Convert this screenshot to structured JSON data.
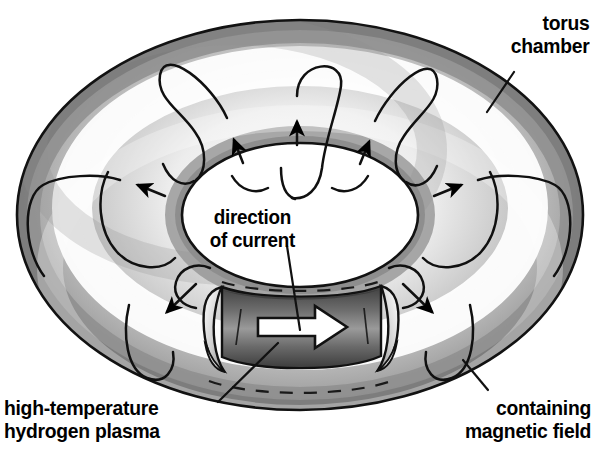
{
  "diagram": {
    "background_color": "#ffffff",
    "ink_color": "#000000",
    "labels": {
      "torus_chamber": "torus\nchamber",
      "direction_of_current": "direction\nof current",
      "plasma": "high-temperature\nhydrogen plasma",
      "magnetic_field": "containing\nmagnetic field"
    },
    "colors": {
      "torus_light": "#ffffff",
      "torus_mid": "#b4b4b4",
      "torus_dark": "#7a7a7a",
      "torus_edge": "#9a9a9a",
      "plasma_dark": "#4f4f4f",
      "plasma_mid": "#8c8c8c",
      "outline": "#111111",
      "arrow_fill": "#ffffff"
    },
    "geometry": {
      "torus_center_x": 300,
      "torus_center_y": 215,
      "outer_rx": 283,
      "outer_ry": 195,
      "hole_rx": 118,
      "hole_ry": 72,
      "cutaway_left_x": 215,
      "cutaway_right_x": 385,
      "cutaway_top_y": 278,
      "cutaway_bottom_y": 380
    },
    "elements": {
      "field_line_count": 12,
      "arrowhead_count": 8,
      "current_arrow": "white-right-arrow",
      "hidden_outline_style": "dashed"
    }
  }
}
